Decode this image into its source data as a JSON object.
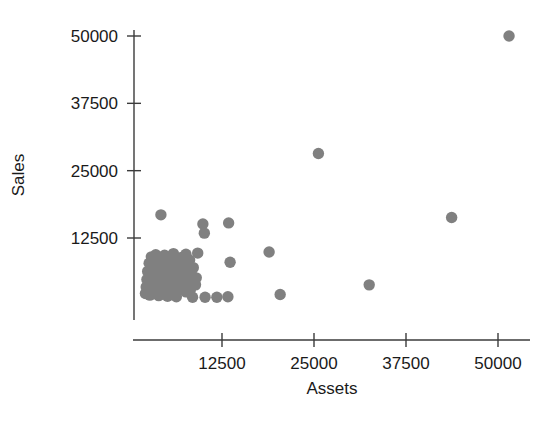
{
  "chart_data": {
    "type": "scatter",
    "title": "",
    "xlabel": "Assets",
    "ylabel": "Sales",
    "xlim": [
      0,
      56000
    ],
    "ylim": [
      0,
      53000
    ],
    "xticks": [
      12500,
      25000,
      37500,
      50000
    ],
    "yticks": [
      12500,
      25000,
      37500,
      50000
    ],
    "xtick_labels": [
      "12500",
      "25000",
      "37500",
      "50000"
    ],
    "ytick_labels": [
      "12500",
      "25000",
      "37500",
      "50000"
    ],
    "grid": false,
    "legend": null,
    "marker": {
      "shape": "circle",
      "color": "#808080",
      "size": 7
    },
    "n_points": 79,
    "points": [
      {
        "x": 51500,
        "y": 50000
      },
      {
        "x": 25600,
        "y": 28200
      },
      {
        "x": 43700,
        "y": 16300
      },
      {
        "x": 4200,
        "y": 16800
      },
      {
        "x": 9900,
        "y": 15100
      },
      {
        "x": 13400,
        "y": 15300
      },
      {
        "x": 10100,
        "y": 13400
      },
      {
        "x": 32500,
        "y": 3800
      },
      {
        "x": 18900,
        "y": 9900
      },
      {
        "x": 13600,
        "y": 8000
      },
      {
        "x": 9200,
        "y": 9700
      },
      {
        "x": 20400,
        "y": 2000
      },
      {
        "x": 2900,
        "y": 9000
      },
      {
        "x": 3500,
        "y": 9400
      },
      {
        "x": 4100,
        "y": 8500
      },
      {
        "x": 4700,
        "y": 9300
      },
      {
        "x": 5300,
        "y": 8700
      },
      {
        "x": 5900,
        "y": 9600
      },
      {
        "x": 6400,
        "y": 8200
      },
      {
        "x": 7000,
        "y": 8900
      },
      {
        "x": 7600,
        "y": 9500
      },
      {
        "x": 8100,
        "y": 8400
      },
      {
        "x": 2600,
        "y": 7800
      },
      {
        "x": 3200,
        "y": 7200
      },
      {
        "x": 3800,
        "y": 7600
      },
      {
        "x": 4400,
        "y": 7000
      },
      {
        "x": 5000,
        "y": 7500
      },
      {
        "x": 5600,
        "y": 6900
      },
      {
        "x": 6200,
        "y": 7300
      },
      {
        "x": 6800,
        "y": 6700
      },
      {
        "x": 7400,
        "y": 7100
      },
      {
        "x": 8000,
        "y": 6500
      },
      {
        "x": 8600,
        "y": 7000
      },
      {
        "x": 2400,
        "y": 6300
      },
      {
        "x": 3000,
        "y": 5900
      },
      {
        "x": 3600,
        "y": 6200
      },
      {
        "x": 4200,
        "y": 5700
      },
      {
        "x": 4800,
        "y": 6100
      },
      {
        "x": 5400,
        "y": 5500
      },
      {
        "x": 6000,
        "y": 6000
      },
      {
        "x": 6600,
        "y": 5400
      },
      {
        "x": 7200,
        "y": 5800
      },
      {
        "x": 7800,
        "y": 5200
      },
      {
        "x": 8400,
        "y": 5600
      },
      {
        "x": 9000,
        "y": 5100
      },
      {
        "x": 2300,
        "y": 4800
      },
      {
        "x": 2900,
        "y": 4400
      },
      {
        "x": 3500,
        "y": 4700
      },
      {
        "x": 4100,
        "y": 4200
      },
      {
        "x": 4700,
        "y": 4600
      },
      {
        "x": 5300,
        "y": 4100
      },
      {
        "x": 5900,
        "y": 4500
      },
      {
        "x": 6500,
        "y": 4000
      },
      {
        "x": 7100,
        "y": 4400
      },
      {
        "x": 7700,
        "y": 3900
      },
      {
        "x": 8300,
        "y": 4300
      },
      {
        "x": 8900,
        "y": 3800
      },
      {
        "x": 2200,
        "y": 3400
      },
      {
        "x": 2800,
        "y": 3000
      },
      {
        "x": 3400,
        "y": 3300
      },
      {
        "x": 4000,
        "y": 2900
      },
      {
        "x": 4600,
        "y": 3200
      },
      {
        "x": 5200,
        "y": 2700
      },
      {
        "x": 5800,
        "y": 3100
      },
      {
        "x": 6400,
        "y": 2600
      },
      {
        "x": 7000,
        "y": 3000
      },
      {
        "x": 7600,
        "y": 2500
      },
      {
        "x": 8200,
        "y": 2900
      },
      {
        "x": 2100,
        "y": 2200
      },
      {
        "x": 2700,
        "y": 1900
      },
      {
        "x": 3300,
        "y": 2300
      },
      {
        "x": 3900,
        "y": 1800
      },
      {
        "x": 4500,
        "y": 2100
      },
      {
        "x": 5100,
        "y": 1700
      },
      {
        "x": 5700,
        "y": 2000
      },
      {
        "x": 6300,
        "y": 1600
      },
      {
        "x": 8500,
        "y": 1500
      },
      {
        "x": 10200,
        "y": 1500
      },
      {
        "x": 11800,
        "y": 1500
      },
      {
        "x": 13300,
        "y": 1600
      }
    ]
  }
}
